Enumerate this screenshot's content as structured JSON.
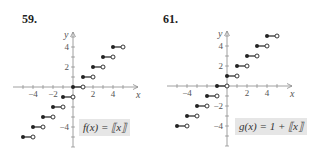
{
  "chart_data": [
    {
      "type": "line",
      "number": "59.",
      "title": "f(x) = [[x]]",
      "label_text": "f(x) = ⟦x⟧",
      "xlabel": "x",
      "ylabel": "y",
      "xticks": [
        -4,
        -2,
        2,
        4
      ],
      "yticks": [
        4,
        2,
        -4
      ],
      "xlim": [
        -5.5,
        6.5
      ],
      "ylim": [
        -6,
        5.5
      ],
      "step_function": "floor",
      "segments": [
        {
          "x0": -5,
          "x1": -4,
          "y": -5
        },
        {
          "x0": -4,
          "x1": -3,
          "y": -4
        },
        {
          "x0": -3,
          "x1": -2,
          "y": -3
        },
        {
          "x0": -2,
          "x1": -1,
          "y": -2
        },
        {
          "x0": -1,
          "x1": 0,
          "y": -1
        },
        {
          "x0": 0,
          "x1": 1,
          "y": 0
        },
        {
          "x0": 1,
          "x1": 2,
          "y": 1
        },
        {
          "x0": 2,
          "x1": 3,
          "y": 2
        },
        {
          "x0": 3,
          "x1": 4,
          "y": 3
        },
        {
          "x0": 4,
          "x1": 5,
          "y": 4
        }
      ],
      "closed_left_endpoint": true,
      "open_right_endpoint": true
    },
    {
      "type": "line",
      "number": "61.",
      "title": "g(x) = 1 + [[x]]",
      "label_text": "g(x) = 1 + ⟦x⟧",
      "xlabel": "x",
      "ylabel": "y",
      "xticks": [
        -4,
        2,
        4
      ],
      "yticks": [
        4,
        2,
        -2,
        -4
      ],
      "xlim": [
        -5.5,
        6.5
      ],
      "ylim": [
        -6,
        5.5
      ],
      "step_function": "1 + floor",
      "segments": [
        {
          "x0": -5,
          "x1": -4,
          "y": -4
        },
        {
          "x0": -4,
          "x1": -3,
          "y": -3
        },
        {
          "x0": -3,
          "x1": -2,
          "y": -2
        },
        {
          "x0": -2,
          "x1": -1,
          "y": -1
        },
        {
          "x0": -1,
          "x1": 0,
          "y": 0
        },
        {
          "x0": 0,
          "x1": 1,
          "y": 1
        },
        {
          "x0": 1,
          "x1": 2,
          "y": 2
        },
        {
          "x0": 2,
          "x1": 3,
          "y": 3
        },
        {
          "x0": 3,
          "x1": 4,
          "y": 4
        },
        {
          "x0": 4,
          "x1": 5,
          "y": 5
        }
      ],
      "closed_left_endpoint": true,
      "open_right_endpoint": true
    }
  ],
  "colors": {
    "ink": "#222222",
    "axis": "#888888",
    "label_bg": "#e6e6e6"
  }
}
